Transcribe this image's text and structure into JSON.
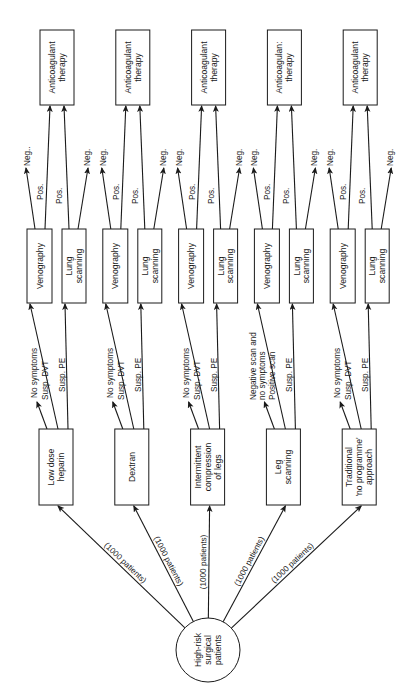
{
  "diagram": {
    "root": {
      "label_lines": [
        "High-risk",
        "surgical",
        "patients"
      ]
    },
    "groups": [
      {
        "branch_label": "(1000 patients)",
        "intervention_lines": [
          "Low dose",
          "heparin"
        ],
        "screen_labels": [
          "No symptoms",
          "Susp. DVT",
          "Susp. PE"
        ],
        "venography": "Venography",
        "lung_lines": [
          "Lung",
          "scanning"
        ],
        "ven_neg": "Neg..",
        "ven_pos": "Pos.",
        "lung_pos": "Pos.",
        "lung_neg": "Neg.",
        "therapy_lines": [
          "Anticoagulant",
          "therapy"
        ]
      },
      {
        "branch_label": "(1000 patients)",
        "intervention_lines": [
          "Dextran"
        ],
        "screen_labels": [
          "No symptoms",
          "Susp. DVT",
          "Susp. PE"
        ],
        "venography": "Venography",
        "lung_lines": [
          "Lung",
          "scanning"
        ],
        "ven_neg": "Neg.",
        "ven_pos": "Pos.",
        "lung_pos": "Pos.",
        "lung_neg": "Neg.",
        "therapy_lines": [
          "Anticoagulant",
          "therapy"
        ]
      },
      {
        "branch_label": "(1000 patients)",
        "intervention_lines": [
          "Intermittent",
          "compression",
          "of legs"
        ],
        "screen_labels": [
          "No symptoms",
          "Susp. DVT",
          "Susp. PE"
        ],
        "venography": "Venography",
        "lung_lines": [
          "Lung",
          "scanning"
        ],
        "ven_neg": "Neg.",
        "ven_pos": "Pos.",
        "lung_pos": "Pos.",
        "lung_neg": "Neg.",
        "therapy_lines": [
          "Anticoagulant",
          "therapy"
        ]
      },
      {
        "branch_label": "(1000 patients)",
        "intervention_lines": [
          "Leg",
          "scanning"
        ],
        "screen_labels": [
          "Negative scan and|no symptoms",
          "Positive scan",
          "Susp. PE"
        ],
        "venography": "Venography",
        "lung_lines": [
          "Lung",
          "scanning"
        ],
        "ven_neg": "Neg.",
        "ven_pos": "Pos.",
        "lung_pos": "Pos.",
        "lung_neg": "Neg.",
        "therapy_lines": [
          "Anticoagulan:",
          "therapy"
        ]
      },
      {
        "branch_label": "(1000 patients)",
        "intervention_lines": [
          "Traditional",
          "'no programme'",
          "approach"
        ],
        "screen_labels": [
          "No symptoms",
          "Susp. DVT",
          "Susp. PE"
        ],
        "venography": "Venography",
        "lung_lines": [
          "Lung",
          "scanning"
        ],
        "ven_neg": "Neg.",
        "ven_pos": "Pos.",
        "lung_pos": "Pos.",
        "lung_neg": "Neg.",
        "therapy_lines": [
          "Anticoagulant",
          "therapy"
        ]
      }
    ]
  }
}
